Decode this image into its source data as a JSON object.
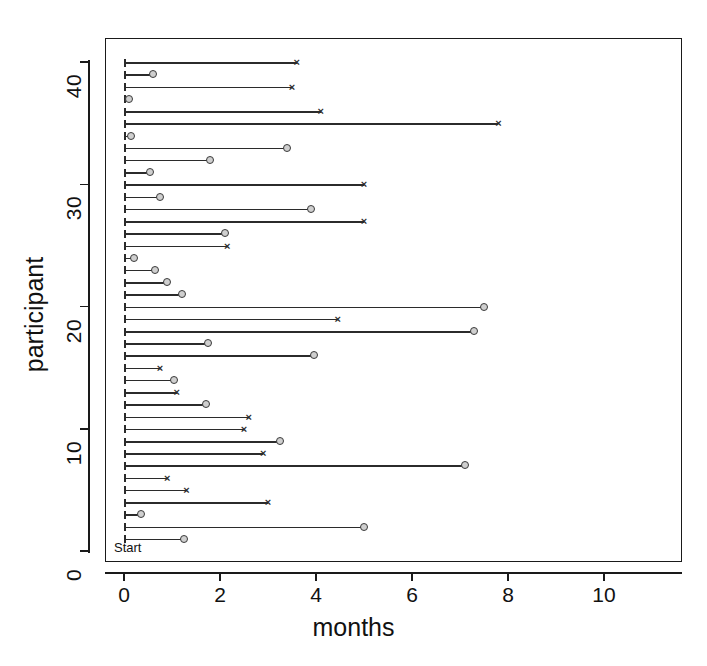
{
  "chart_data": {
    "type": "scatter",
    "title": "",
    "xlabel": "months",
    "ylabel": "participant",
    "xlim": [
      -0.35,
      11.6
    ],
    "ylim": [
      -1.2,
      43.5
    ],
    "grid": false,
    "legend": null,
    "annotations": [
      {
        "text": "Start",
        "x": 0.05,
        "y": 0.2
      }
    ],
    "xticks": [
      0,
      2,
      4,
      6,
      8,
      10
    ],
    "xtick_labels": [
      "0",
      "2",
      "4",
      "6",
      "8",
      "10"
    ],
    "yticks": [
      0,
      10,
      20,
      30,
      40
    ],
    "ytick_labels": [
      "0",
      "10",
      "20",
      "30",
      "40"
    ],
    "yminor_step": 1,
    "marker_legend": {
      "circle": "circle-endpoint",
      "cross": "cross-endpoint"
    },
    "points": [
      {
        "participant": 40,
        "months": 3.6,
        "marker": "cross"
      },
      {
        "participant": 39,
        "months": 0.6,
        "marker": "circle"
      },
      {
        "participant": 38,
        "months": 3.5,
        "marker": "cross"
      },
      {
        "participant": 37,
        "months": 0.1,
        "marker": "circle"
      },
      {
        "participant": 36,
        "months": 4.1,
        "marker": "cross"
      },
      {
        "participant": 35,
        "months": 7.8,
        "marker": "cross"
      },
      {
        "participant": 34,
        "months": 0.15,
        "marker": "circle"
      },
      {
        "participant": 33,
        "months": 3.4,
        "marker": "circle"
      },
      {
        "participant": 32,
        "months": 1.8,
        "marker": "circle"
      },
      {
        "participant": 31,
        "months": 0.55,
        "marker": "circle"
      },
      {
        "participant": 30,
        "months": 5.0,
        "marker": "cross"
      },
      {
        "participant": 29,
        "months": 0.75,
        "marker": "circle"
      },
      {
        "participant": 28,
        "months": 3.9,
        "marker": "circle"
      },
      {
        "participant": 27,
        "months": 5.0,
        "marker": "cross"
      },
      {
        "participant": 26,
        "months": 2.1,
        "marker": "circle"
      },
      {
        "participant": 25,
        "months": 2.15,
        "marker": "cross"
      },
      {
        "participant": 24,
        "months": 0.2,
        "marker": "circle"
      },
      {
        "participant": 23,
        "months": 0.65,
        "marker": "circle"
      },
      {
        "participant": 22,
        "months": 0.9,
        "marker": "circle"
      },
      {
        "participant": 21,
        "months": 1.2,
        "marker": "circle"
      },
      {
        "participant": 20,
        "months": 7.5,
        "marker": "circle"
      },
      {
        "participant": 19,
        "months": 4.45,
        "marker": "cross"
      },
      {
        "participant": 18,
        "months": 7.3,
        "marker": "circle"
      },
      {
        "participant": 17,
        "months": 1.75,
        "marker": "circle"
      },
      {
        "participant": 16,
        "months": 3.95,
        "marker": "circle"
      },
      {
        "participant": 15,
        "months": 0.75,
        "marker": "cross"
      },
      {
        "participant": 14,
        "months": 1.05,
        "marker": "circle"
      },
      {
        "participant": 13,
        "months": 1.1,
        "marker": "cross"
      },
      {
        "participant": 12,
        "months": 1.7,
        "marker": "circle"
      },
      {
        "participant": 11,
        "months": 2.6,
        "marker": "cross"
      },
      {
        "participant": 10,
        "months": 2.5,
        "marker": "cross"
      },
      {
        "participant": 9,
        "months": 3.25,
        "marker": "circle"
      },
      {
        "participant": 8,
        "months": 2.9,
        "marker": "cross"
      },
      {
        "participant": 7,
        "months": 7.1,
        "marker": "circle"
      },
      {
        "participant": 6,
        "months": 0.9,
        "marker": "cross"
      },
      {
        "participant": 5,
        "months": 1.3,
        "marker": "cross"
      },
      {
        "participant": 4,
        "months": 3.0,
        "marker": "cross"
      },
      {
        "participant": 3,
        "months": 0.35,
        "marker": "circle"
      },
      {
        "participant": 2,
        "months": 5.0,
        "marker": "circle"
      },
      {
        "participant": 1,
        "months": 1.25,
        "marker": "circle"
      }
    ]
  },
  "colors": {
    "axis": "#1a1a1a",
    "line": "#2b2b2b",
    "marker_fill": "#cfcfcf",
    "marker_stroke": "#3a3a3a",
    "background": "#ffffff"
  },
  "glyphs": {
    "cross": "×"
  }
}
